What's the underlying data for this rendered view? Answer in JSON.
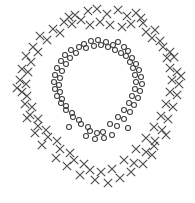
{
  "figure": {
    "width": 195,
    "height": 203,
    "background": "#ffffff",
    "title": "",
    "xlabel": "",
    "ylabel": "",
    "axes_visible": false,
    "grid_visible": false,
    "tick_labels_visible": false,
    "legend_visible": false
  },
  "style": {
    "cross_color": "#4d4d4d",
    "circle_color": "#3d3d3d",
    "cross_stroke_width": 1.15,
    "circle_stroke_width": 1.05,
    "cross_arm": 4.2,
    "circle_radius": 2.5
  },
  "chart_data": {
    "type": "scatter",
    "title": "",
    "xlabel": "",
    "ylabel": "",
    "grid": false,
    "legend": null,
    "xlim": [
      0,
      195
    ],
    "ylim": [
      0,
      203
    ],
    "series": [
      {
        "name": "outer-ring",
        "marker": "x",
        "color": "#4d4d4d",
        "count": 64,
        "points": [
          [
            75,
            15
          ],
          [
            88,
            11
          ],
          [
            97,
            9
          ],
          [
            107,
            14
          ],
          [
            118,
            10
          ],
          [
            127,
            16
          ],
          [
            136,
            13
          ],
          [
            64,
            22
          ],
          [
            72,
            24
          ],
          [
            81,
            20
          ],
          [
            90,
            25
          ],
          [
            100,
            22
          ],
          [
            110,
            25
          ],
          [
            122,
            27
          ],
          [
            131,
            24
          ],
          [
            143,
            23
          ],
          [
            53,
            29
          ],
          [
            60,
            33
          ],
          [
            146,
            32
          ],
          [
            155,
            30
          ],
          [
            40,
            36
          ],
          [
            47,
            40
          ],
          [
            152,
            38
          ],
          [
            160,
            41
          ],
          [
            33,
            47
          ],
          [
            38,
            52
          ],
          [
            163,
            47
          ],
          [
            170,
            52
          ],
          [
            26,
            56
          ],
          [
            31,
            62
          ],
          [
            167,
            58
          ],
          [
            174,
            57
          ],
          [
            22,
            69
          ],
          [
            28,
            72
          ],
          [
            170,
            68
          ],
          [
            177,
            72
          ],
          [
            20,
            80
          ],
          [
            26,
            84
          ],
          [
            172,
            80
          ],
          [
            179,
            84
          ],
          [
            22,
            92
          ],
          [
            27,
            96
          ],
          [
            170,
            92
          ],
          [
            177,
            95
          ],
          [
            25,
            104
          ],
          [
            32,
            107
          ],
          [
            166,
            104
          ],
          [
            173,
            107
          ],
          [
            30,
            115
          ],
          [
            38,
            119
          ],
          [
            161,
            116
          ],
          [
            168,
            119
          ],
          [
            38,
            126
          ],
          [
            46,
            130
          ],
          [
            154,
            127
          ],
          [
            162,
            130
          ],
          [
            48,
            137
          ],
          [
            57,
            141
          ],
          [
            146,
            138
          ],
          [
            155,
            141
          ],
          [
            60,
            149
          ],
          [
            70,
            153
          ],
          [
            136,
            149
          ],
          [
            146,
            152
          ],
          [
            74,
            160
          ],
          [
            84,
            164
          ],
          [
            124,
            160
          ],
          [
            134,
            163
          ],
          [
            90,
            170
          ],
          [
            101,
            172
          ],
          [
            112,
            169
          ],
          [
            80,
            175
          ],
          [
            95,
            180
          ],
          [
            108,
            183
          ],
          [
            120,
            178
          ],
          [
            131,
            172
          ],
          [
            143,
            164
          ],
          [
            152,
            155
          ],
          [
            27,
            118
          ],
          [
            42,
            145
          ],
          [
            56,
            158
          ],
          [
            67,
            166
          ],
          [
            154,
            146
          ],
          [
            166,
            135
          ],
          [
            35,
            133
          ],
          [
            17,
            88
          ],
          [
            181,
            76
          ],
          [
            69,
            17
          ],
          [
            141,
            18
          ]
        ]
      },
      {
        "name": "inner-ring",
        "marker": "o",
        "color": "#3d3d3d",
        "count": 60,
        "points": [
          [
            84,
            44
          ],
          [
            91,
            41
          ],
          [
            98,
            40
          ],
          [
            106,
            42
          ],
          [
            113,
            45
          ],
          [
            79,
            47
          ],
          [
            86,
            48
          ],
          [
            94,
            46
          ],
          [
            101,
            45
          ],
          [
            108,
            47
          ],
          [
            118,
            42
          ],
          [
            124,
            47
          ],
          [
            71,
            50
          ],
          [
            76,
            53
          ],
          [
            115,
            50
          ],
          [
            121,
            53
          ],
          [
            128,
            51
          ],
          [
            65,
            55
          ],
          [
            70,
            58
          ],
          [
            126,
            56
          ],
          [
            132,
            58
          ],
          [
            61,
            61
          ],
          [
            66,
            64
          ],
          [
            130,
            62
          ],
          [
            136,
            64
          ],
          [
            57,
            68
          ],
          [
            62,
            71
          ],
          [
            133,
            68
          ],
          [
            139,
            70
          ],
          [
            55,
            75
          ],
          [
            60,
            78
          ],
          [
            135,
            75
          ],
          [
            141,
            77
          ],
          [
            54,
            82
          ],
          [
            59,
            85
          ],
          [
            136,
            82
          ],
          [
            142,
            84
          ],
          [
            55,
            89
          ],
          [
            60,
            92
          ],
          [
            135,
            89
          ],
          [
            140,
            91
          ],
          [
            57,
            96
          ],
          [
            62,
            99
          ],
          [
            132,
            96
          ],
          [
            138,
            98
          ],
          [
            61,
            103
          ],
          [
            66,
            106
          ],
          [
            129,
            103
          ],
          [
            134,
            105
          ],
          [
            66,
            110
          ],
          [
            72,
            113
          ],
          [
            124,
            110
          ],
          [
            130,
            112
          ],
          [
            73,
            117
          ],
          [
            79,
            120
          ],
          [
            118,
            117
          ],
          [
            124,
            119
          ],
          [
            81,
            124
          ],
          [
            88,
            127
          ],
          [
            110,
            124
          ],
          [
            117,
            126
          ],
          [
            90,
            131
          ],
          [
            97,
            133
          ],
          [
            103,
            132
          ],
          [
            95,
            139
          ],
          [
            104,
            138
          ],
          [
            86,
            136
          ],
          [
            112,
            135
          ],
          [
            69,
            127
          ],
          [
            128,
            128
          ]
        ]
      }
    ]
  }
}
